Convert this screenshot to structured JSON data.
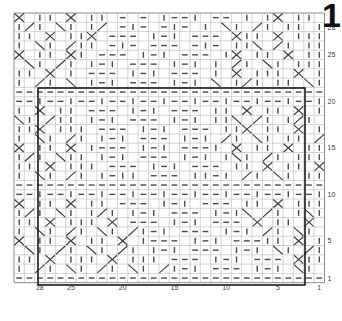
{
  "page": {
    "title": "1",
    "background_color": "#ffffff"
  },
  "chart_data": {
    "type": "heatmap",
    "title": "1",
    "subtitle": "",
    "xlabel": "",
    "ylabel": "",
    "grid": {
      "columns": 30,
      "rows": 29,
      "cell_width": 10.35,
      "cell_height": 9.3,
      "origin_x": 14,
      "origin_y": 13,
      "line_color": "#b9b9b9",
      "grid_on": true
    },
    "symbol_colors": {
      "stitch": "#4a4a4a",
      "cable": "#3d3d3d",
      "repeat_box": "#1a1a1a",
      "border": "#8a8a8a"
    },
    "repeat_box": {
      "x": 38,
      "y": 88,
      "width": 267,
      "height": 197,
      "stroke_width": 1.6
    },
    "x_axis": {
      "position": "bottom",
      "direction": "right-to-left",
      "ticks": [
        {
          "label": "28",
          "col": 28
        },
        {
          "label": "25",
          "col": 25
        },
        {
          "label": "20",
          "col": 20
        },
        {
          "label": "15",
          "col": 15
        },
        {
          "label": "10",
          "col": 10
        },
        {
          "label": "5",
          "col": 5
        },
        {
          "label": "1",
          "col": 1
        }
      ]
    },
    "y_axis": {
      "position": "right",
      "direction": "bottom-to-top",
      "ticks": [
        {
          "label": "28",
          "row": 28
        },
        {
          "label": "25",
          "row": 25
        },
        {
          "label": "20",
          "row": 20
        },
        {
          "label": "15",
          "row": 15
        },
        {
          "label": "10",
          "row": 10
        },
        {
          "label": "5",
          "row": 5
        },
        {
          "label": "1",
          "row": 1
        }
      ]
    },
    "symbol_legend": [
      {
        "key": "v",
        "name": "vertical-dash",
        "meaning": "knit stitch"
      },
      {
        "key": "h",
        "name": "horizontal-dash",
        "meaning": "purl stitch"
      },
      {
        "key": "x",
        "name": "cross-cable",
        "meaning": "cable cross"
      },
      {
        "key": "/",
        "name": "right-twist",
        "meaning": "right-leaning twist"
      },
      {
        "key": "\\",
        "name": "left-twist",
        "meaning": "left-leaning twist"
      },
      {
        "key": ")",
        "name": "curve-right",
        "meaning": "travelling stitch right"
      },
      {
        "key": "(",
        "name": "curve-left",
        "meaning": "travelling stitch left"
      },
      {
        "key": ".",
        "name": "empty-cell",
        "meaning": "no stitch"
      }
    ],
    "rows": [
      "x.vv.x.vv.h.h.vhhv.hh.v.vx.vv.x",
      "v/v.\\v.v/.hvh.hvh.v.\\v./v.vv.v",
      "vv.x.vvx.hhh.vhv.hhh.xvv.x.vvv",
      "v.\\v./vv.hvh.hhh.hvh.vv\\./v.vv",
      "x.vv.xv.hhh.vhv.hhh.vx.vv.x.vv",
      ".\\v./v.vhv.hhh.vhv.v./v.\\v.vvv",
      "vv.x.v.hhh.vhv.hhh.v.x.vvv.x.v",
      "v./v.\\.vhv.hhh.vhv.\\.v/v.vv.\\v",
      "hhhhhhhhhhhhhhhhhhhhhhhhhhhhhh",
      "hhvhhvhhvhhvhhvhhvhhvhhvhhvhhv",
      "v.x.vv.hhh.vhv.hhh.vv.x.vv.x.v",
      "\\v./vv.vhv.hhh.vhv.vv\\./v.v/v.",
      "vvx.vvv.hhh.vhv.hhh.vvx.vv.x.v",
      "v.\\v./v.vhv.hhh.vhv./v.\\v.vv./",
      "x.vv.x.vhhh.vhv.hhhv.x.vv.x.vv",
      "v/v.\\vv.vhv.hhh.vhv.v\\v./v.vvv",
      "vv.x.vvv.hhh.vhv.hhh.vv.x.vv.x",
      "v.\\v./v.vhvv.hhh.vvhv./v.\\v.vv",
      "hhhhhhhhhhhhhhhhhhhhhhhhhhhhhh",
      "hhvhhvhhvhhvhhvhhvhhvhhvhhvhhv",
      "x.vv.x.vv.hhh.vhv.hhh.vv.x.vvv",
      "v/v.\\v.v/v.vhv.hhh.vhv\\./v.v\\v",
      "vv.x.vvv.x.hhh.vhv.hhh.x.vv.x.",
      "v.\\v./v.\\v./vhv.hhh.vhv./v.\\v.",
      "x.vv.x.vv.x.vhhh.vhv.hhhvv.x.v",
      ".\\v./v.\\v./v.vhv.hhh.vhv.\\v./v",
      "vv.x.vvv.x.vvv.hhh.vhv.hhh.xvv",
      "v./v.\\v./v.\\v./vhv.hhh.vhv.\\v.",
      "hhhhhhhhhhhhhhhhhhhhhhhhhhhhhh"
    ]
  }
}
